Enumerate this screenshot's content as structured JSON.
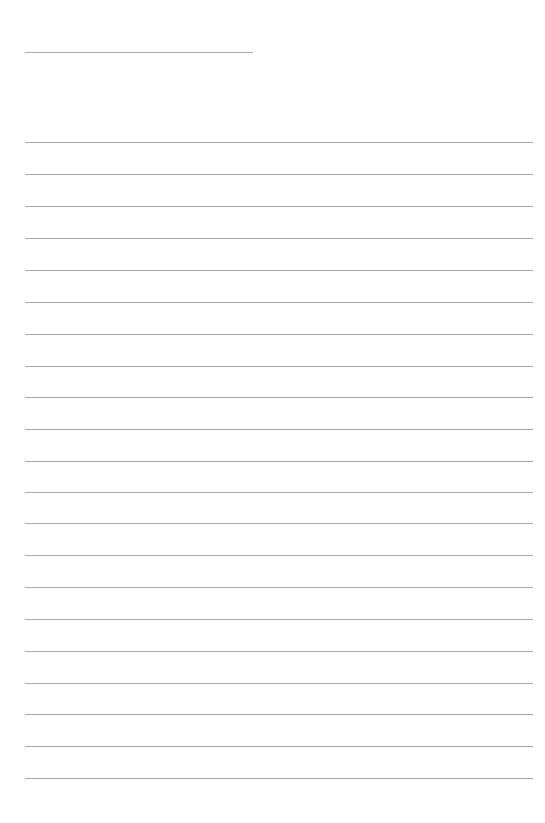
{
  "document": {
    "kind": "blank-lined-writing-sheet",
    "title_text": "",
    "page_width": 545,
    "page_height": 823,
    "background_color": "#ffffff",
    "rule_color": "#a9a9a9",
    "rule_thickness": 1
  },
  "header": {
    "title_rule": {
      "label": "title-blank-line",
      "x": 25,
      "y": 52,
      "width": 228
    },
    "gap_note": ""
  },
  "body": {
    "left_margin": 25,
    "right_edge": 533,
    "line_width": 508,
    "first_line_y": 142,
    "line_spacing": 31.85,
    "line_count": 21,
    "lines": [
      {
        "index": 1,
        "y": 142,
        "text": ""
      },
      {
        "index": 2,
        "y": 174,
        "text": ""
      },
      {
        "index": 3,
        "y": 206,
        "text": ""
      },
      {
        "index": 4,
        "y": 238,
        "text": ""
      },
      {
        "index": 5,
        "y": 270,
        "text": ""
      },
      {
        "index": 6,
        "y": 302,
        "text": ""
      },
      {
        "index": 7,
        "y": 334,
        "text": ""
      },
      {
        "index": 8,
        "y": 366,
        "text": ""
      },
      {
        "index": 9,
        "y": 397,
        "text": ""
      },
      {
        "index": 10,
        "y": 429,
        "text": ""
      },
      {
        "index": 11,
        "y": 461,
        "text": ""
      },
      {
        "index": 12,
        "y": 492,
        "text": ""
      },
      {
        "index": 13,
        "y": 523,
        "text": ""
      },
      {
        "index": 14,
        "y": 555,
        "text": ""
      },
      {
        "index": 15,
        "y": 587,
        "text": ""
      },
      {
        "index": 16,
        "y": 619,
        "text": ""
      },
      {
        "index": 17,
        "y": 651,
        "text": ""
      },
      {
        "index": 18,
        "y": 683,
        "text": ""
      },
      {
        "index": 19,
        "y": 714,
        "text": ""
      },
      {
        "index": 20,
        "y": 746,
        "text": ""
      },
      {
        "index": 21,
        "y": 778,
        "text": ""
      }
    ]
  },
  "footer": {
    "bottom_margin_top": 779,
    "content": ""
  }
}
